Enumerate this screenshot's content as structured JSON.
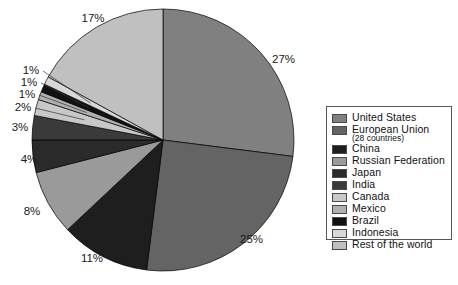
{
  "chart_data": {
    "type": "pie",
    "title": "",
    "labels": [
      "United States",
      "European Union",
      "China",
      "Russian Federation",
      "Japan",
      "India",
      "Canada",
      "Mexico",
      "Brazil",
      "Indonesia",
      "Rest of the world"
    ],
    "values": [
      27,
      25,
      11,
      8,
      4,
      3,
      2,
      1,
      1,
      1,
      17
    ],
    "value_labels": [
      "27%",
      "25%",
      "11%",
      "8%",
      "4%",
      "3%",
      "2%",
      "1%",
      "1%",
      "1%",
      "17%"
    ],
    "colors": [
      "#808080",
      "#646464",
      "#1e1e1e",
      "#9a9a9a",
      "#2b2b2b",
      "#3a3a3a",
      "#c8c8c8",
      "#b0b0b0",
      "#111111",
      "#d8d8d8",
      "#c0c0c0"
    ],
    "start_angle_deg": 0,
    "direction": "clockwise",
    "units": "percent",
    "legend_position": "right",
    "grid": false
  },
  "legend": {
    "items": [
      {
        "label": "United States",
        "sublabel": "",
        "color": "#808080"
      },
      {
        "label": "European Union",
        "sublabel": "(28 countries)",
        "color": "#646464"
      },
      {
        "label": "China",
        "sublabel": "",
        "color": "#1e1e1e"
      },
      {
        "label": "Russian Federation",
        "sublabel": "",
        "color": "#9a9a9a"
      },
      {
        "label": "Japan",
        "sublabel": "",
        "color": "#2b2b2b"
      },
      {
        "label": "India",
        "sublabel": "",
        "color": "#3a3a3a"
      },
      {
        "label": "Canada",
        "sublabel": "",
        "color": "#c8c8c8"
      },
      {
        "label": "Mexico",
        "sublabel": "",
        "color": "#b0b0b0"
      },
      {
        "label": "Brazil",
        "sublabel": "",
        "color": "#111111"
      },
      {
        "label": "Indonesia",
        "sublabel": "",
        "color": "#d8d8d8"
      },
      {
        "label": "Rest of the world",
        "sublabel": "",
        "color": "#c0c0c0"
      }
    ]
  },
  "geometry": {
    "center_x": 163,
    "center_y": 140,
    "radius": 131
  }
}
